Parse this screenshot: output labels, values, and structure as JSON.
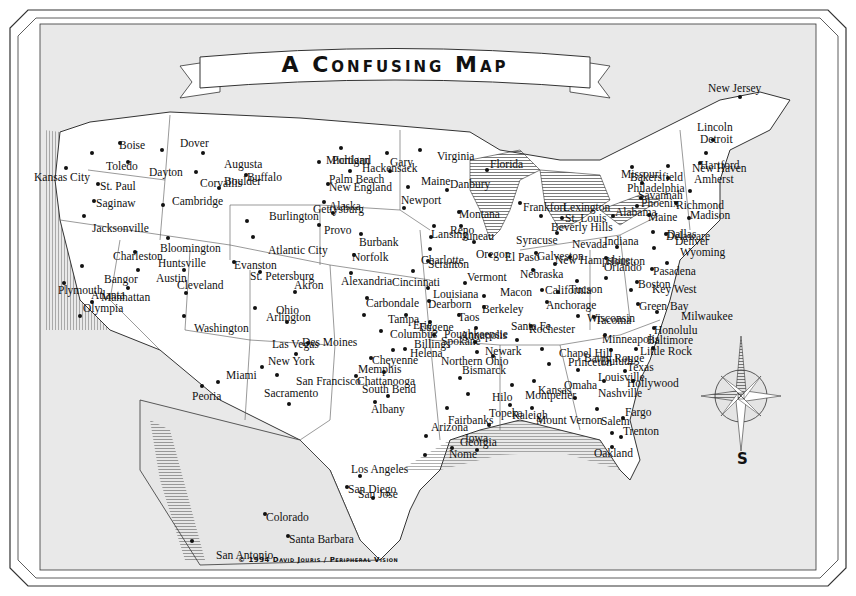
{
  "title": "A Confusing Map",
  "copyright": "© 1994 David Jouris / Peripheral Vision",
  "compass": {
    "label": "S"
  },
  "colors": {
    "land": "#ffffff",
    "water": "#e9e9e9",
    "ink": "#111111",
    "frame": "#333333"
  },
  "cities": [
    {
      "name": "Boise",
      "x": 120,
      "y": 143,
      "dx": -5,
      "dy": 3
    },
    {
      "name": "Toledo",
      "x": 92,
      "y": 153,
      "dx": 10,
      "dy": 14
    },
    {
      "name": "Dayton",
      "x": 128,
      "y": 162,
      "dx": 17,
      "dy": 11
    },
    {
      "name": "Dover",
      "x": 162,
      "y": 150,
      "dx": 14,
      "dy": -6
    },
    {
      "name": "Augusta",
      "x": 203,
      "y": 153,
      "dx": 17,
      "dy": 12
    },
    {
      "name": "Corvallis",
      "x": 196,
      "y": 172,
      "dx": 0,
      "dy": 12
    },
    {
      "name": "Buffalo",
      "x": 246,
      "y": 175,
      "dx": -3,
      "dy": 3
    },
    {
      "name": "Boulder",
      "x": 219,
      "y": 188,
      "dx": 1,
      "dy": -6
    },
    {
      "name": "Kansas City",
      "x": 66,
      "y": 168,
      "dx": 30,
      "dy": 10
    },
    {
      "name": "St. Paul",
      "x": 98,
      "y": 184,
      "dx": -2,
      "dy": 3
    },
    {
      "name": "Saginaw",
      "x": 94,
      "y": 201,
      "dx": -2,
      "dy": 3
    },
    {
      "name": "Jacksonville",
      "x": 84,
      "y": 216,
      "dx": 4,
      "dy": 13
    },
    {
      "name": "Cambridge",
      "x": 163,
      "y": 205,
      "dx": 5,
      "dy": -3
    },
    {
      "name": "Burlington",
      "x": 247,
      "y": 221,
      "dx": 18,
      "dy": -4
    },
    {
      "name": "Atlantic City",
      "x": 253,
      "y": 237,
      "dx": 11,
      "dy": 14
    },
    {
      "name": "Bloomington",
      "x": 168,
      "y": 238,
      "dx": 54,
      "dy": 11
    },
    {
      "name": "Evanston",
      "x": 234,
      "y": 262,
      "dx": -4,
      "dy": 4
    },
    {
      "name": "Charleston",
      "x": 135,
      "y": 252,
      "dx": 34,
      "dy": 5
    },
    {
      "name": "Huntsville",
      "x": 184,
      "y": 270,
      "dx": 30,
      "dy": -6
    },
    {
      "name": "Austin",
      "x": 138,
      "y": 270,
      "dx": 14,
      "dy": 9
    },
    {
      "name": "Bangor",
      "x": 82,
      "y": 266,
      "dx": 18,
      "dy": 14
    },
    {
      "name": "Manhattan",
      "x": 128,
      "y": 288,
      "dx": 23,
      "dy": 10
    },
    {
      "name": "Plymouth",
      "x": 64,
      "y": 283,
      "dx": 38,
      "dy": 8
    },
    {
      "name": "Atlanta",
      "x": 92,
      "y": 302,
      "dx": -5,
      "dy": -6
    },
    {
      "name": "Olympia",
      "x": 80,
      "y": 316,
      "dx": -1,
      "dy": -7
    },
    {
      "name": "Cleveland",
      "x": 186,
      "y": 293,
      "dx": 41,
      "dy": -7
    },
    {
      "name": "Washington",
      "x": 184,
      "y": 316,
      "dx": 6,
      "dy": 13
    },
    {
      "name": "Michigan",
      "x": 341,
      "y": 148,
      "dx": 29,
      "dy": 13
    },
    {
      "name": "Palm Beach",
      "x": 319,
      "y": 162,
      "dx": 6,
      "dy": 18
    },
    {
      "name": "Gary",
      "x": 387,
      "y": 153,
      "dx": 23,
      "dy": 10
    },
    {
      "name": "Portland",
      "x": 350,
      "y": 171,
      "dx": 26,
      "dy": -10
    },
    {
      "name": "Hackensack",
      "x": 390,
      "y": 171,
      "dx": 28,
      "dy": -2
    },
    {
      "name": "New England",
      "x": 328,
      "y": 184,
      "dx": -3,
      "dy": 4
    },
    {
      "name": "Maine",
      "x": 408,
      "y": 187,
      "dx": 9,
      "dy": -5
    },
    {
      "name": "Virginia",
      "x": 420,
      "y": 150,
      "dx": 13,
      "dy": 7
    },
    {
      "name": "Alaska",
      "x": 324,
      "y": 202,
      "dx": 37,
      "dy": 5
    },
    {
      "name": "Gettysburg",
      "x": 333,
      "y": 213,
      "dx": 36,
      "dy": -3
    },
    {
      "name": "Provo",
      "x": 319,
      "y": 225,
      "dx": 1,
      "dy": 6
    },
    {
      "name": "Burbank",
      "x": 361,
      "y": 234,
      "dx": 36,
      "dy": 9
    },
    {
      "name": "Newport",
      "x": 404,
      "y": 208,
      "dx": 35,
      "dy": -7
    },
    {
      "name": "Norfolk",
      "x": 354,
      "y": 255,
      "dx": 36,
      "dy": 3
    },
    {
      "name": "Alexandria",
      "x": 351,
      "y": 273,
      "dx": 46,
      "dy": 9
    },
    {
      "name": "St. Petersburg",
      "x": 260,
      "y": 272,
      "dx": 70,
      "dy": 5
    },
    {
      "name": "Akron",
      "x": 295,
      "y": 292,
      "dx": 25,
      "dy": -6
    },
    {
      "name": "Ohio",
      "x": 255,
      "y": 308,
      "dx": 17,
      "dy": 3
    },
    {
      "name": "Arlington",
      "x": 287,
      "y": 322,
      "dx": 29,
      "dy": -4
    },
    {
      "name": "Carbondale",
      "x": 367,
      "y": 298,
      "dx": 55,
      "dy": 6
    },
    {
      "name": "Tampa",
      "x": 364,
      "y": 315,
      "dx": 20,
      "dy": 5
    },
    {
      "name": "Erie",
      "x": 406,
      "y": 315,
      "dx": 3,
      "dy": 11
    },
    {
      "name": "Columbus",
      "x": 381,
      "y": 331,
      "dx": 53,
      "dy": 4
    },
    {
      "name": "Danbury",
      "x": 447,
      "y": 190,
      "dx": -1,
      "dy": -5
    },
    {
      "name": "Florida",
      "x": 487,
      "y": 170,
      "dx": -1,
      "dy": -5
    },
    {
      "name": "Montana",
      "x": 459,
      "y": 212,
      "dx": -4,
      "dy": 3
    },
    {
      "name": "Reno",
      "x": 434,
      "y": 226,
      "dx": 36,
      "dy": 5
    },
    {
      "name": "Juneau",
      "x": 461,
      "y": 226,
      "dx": 33,
      "dy": 11
    },
    {
      "name": "Lansing",
      "x": 431,
      "y": 237,
      "dx": 38,
      "dy": -2
    },
    {
      "name": "Charlotte",
      "x": 430,
      "y": 249,
      "dx": 41,
      "dy": 12
    },
    {
      "name": "Oregon",
      "x": 474,
      "y": 242,
      "dx": 34,
      "dy": 13
    },
    {
      "name": "Scranton",
      "x": 428,
      "y": 261,
      "dx": -4,
      "dy": 4
    },
    {
      "name": "Cincinnati",
      "x": 413,
      "y": 271,
      "dx": 35,
      "dy": 12
    },
    {
      "name": "El Paso",
      "x": 490,
      "y": 255,
      "dx": 11,
      "dy": 3
    },
    {
      "name": "Vermont",
      "x": 465,
      "y": 283,
      "dx": -2,
      "dy": -5
    },
    {
      "name": "Louisiana",
      "x": 428,
      "y": 288,
      "dx": 55,
      "dy": 7
    },
    {
      "name": "Dearborn",
      "x": 429,
      "y": 301,
      "dx": -5,
      "dy": 4
    },
    {
      "name": "Macon",
      "x": 484,
      "y": 296,
      "dx": 12,
      "dy": -3
    },
    {
      "name": "Taos",
      "x": 459,
      "y": 315,
      "dx": -5,
      "dy": 3
    },
    {
      "name": "Berkeley",
      "x": 484,
      "y": 307,
      "dx": -6,
      "dy": 3
    },
    {
      "name": "Eugene",
      "x": 430,
      "y": 322,
      "dx": 21,
      "dy": 6
    },
    {
      "name": "Annapolis",
      "x": 476,
      "y": 328,
      "dx": 34,
      "dy": 8
    },
    {
      "name": "Spokane",
      "x": 434,
      "y": 335,
      "dx": 3,
      "dy": 7
    },
    {
      "name": "Frankfort",
      "x": 520,
      "y": 203,
      "dx": -1,
      "dy": 5
    },
    {
      "name": "St. Louis",
      "x": 541,
      "y": 216,
      "dx": 20,
      "dy": 3
    },
    {
      "name": "Lexington",
      "x": 562,
      "y": 218,
      "dx": -3,
      "dy": -10
    },
    {
      "name": "Beverly Hills",
      "x": 557,
      "y": 233,
      "dx": -10,
      "dy": -5
    },
    {
      "name": "Syracuse",
      "x": 536,
      "y": 253,
      "dx": 24,
      "dy": -12
    },
    {
      "name": "Nevada",
      "x": 570,
      "y": 257,
      "dx": -2,
      "dy": -12
    },
    {
      "name": "New Hampshire",
      "x": 555,
      "y": 264,
      "dx": -4,
      "dy": -3
    },
    {
      "name": "Galveston",
      "x": 533,
      "y": 270,
      "dx": 54,
      "dy": -13
    },
    {
      "name": "Nebraska",
      "x": 542,
      "y": 290,
      "dx": -26,
      "dy": -15
    },
    {
      "name": "Tucson",
      "x": 577,
      "y": 281,
      "dx": -12,
      "dy": 9
    },
    {
      "name": "California",
      "x": 558,
      "y": 292,
      "dx": -17,
      "dy": -1
    },
    {
      "name": "Anchorage",
      "x": 547,
      "y": 302,
      "dx": -5,
      "dy": 4
    },
    {
      "name": "Wisconsin",
      "x": 578,
      "y": 316,
      "dx": 59,
      "dy": 3
    },
    {
      "name": "Tacoma",
      "x": 594,
      "y": 317,
      "dx": -3,
      "dy": 4
    },
    {
      "name": "Rochester",
      "x": 531,
      "y": 326,
      "dx": -6,
      "dy": 4
    },
    {
      "name": "Santa Fe",
      "x": 517,
      "y": 340,
      "dx": -10,
      "dy": -13
    },
    {
      "name": "Minneapolis",
      "x": 605,
      "y": 335,
      "dx": -7,
      "dy": 5
    },
    {
      "name": "Missouri",
      "x": 632,
      "y": 167,
      "dx": 33,
      "dy": 8
    },
    {
      "name": "Philadelphia",
      "x": 642,
      "y": 183,
      "dx": 53,
      "dy": 6
    },
    {
      "name": "Bakersfield",
      "x": 668,
      "y": 166,
      "dx": 24,
      "dy": 12
    },
    {
      "name": "Phoenix",
      "x": 641,
      "y": 198,
      "dx": -4,
      "dy": 6
    },
    {
      "name": "Savannah",
      "x": 637,
      "y": 206,
      "dx": -3,
      "dy": -10
    },
    {
      "name": "Alabama",
      "x": 613,
      "y": 216,
      "dx": 40,
      "dy": -3
    },
    {
      "name": "Maine",
      "x": 649,
      "y": 215,
      "dx": -5,
      "dy": 3
    },
    {
      "name": "Dallas",
      "x": 653,
      "y": 232,
      "dx": 46,
      "dy": 3
    },
    {
      "name": "Delaware",
      "x": 666,
      "y": 234,
      "dx": -4,
      "dy": 3
    },
    {
      "name": "Indiana",
      "x": 617,
      "y": 247,
      "dx": 25,
      "dy": -5
    },
    {
      "name": "Denver",
      "x": 654,
      "y": 248,
      "dx": 17,
      "dy": -6
    },
    {
      "name": "Houston",
      "x": 606,
      "y": 258,
      "dx": -4,
      "dy": 4
    },
    {
      "name": "Wyoming",
      "x": 667,
      "y": 263,
      "dx": 9,
      "dy": -10
    },
    {
      "name": "Pasadena",
      "x": 652,
      "y": 269,
      "dx": -3,
      "dy": 3
    },
    {
      "name": "Orlando",
      "x": 606,
      "y": 278,
      "dx": -6,
      "dy": -10
    },
    {
      "name": "Boston",
      "x": 637,
      "y": 282,
      "dx": -3,
      "dy": 3
    },
    {
      "name": "Key West",
      "x": 631,
      "y": 290,
      "dx": 17,
      "dy": 0
    },
    {
      "name": "Green Bay",
      "x": 638,
      "y": 304,
      "dx": -3,
      "dy": 3
    },
    {
      "name": "Milwaukee",
      "x": 657,
      "y": 312,
      "dx": 20,
      "dy": 5
    },
    {
      "name": "Honolulu",
      "x": 654,
      "y": 328,
      "dx": -4,
      "dy": 3
    },
    {
      "name": "Baltimore",
      "x": 653,
      "y": 348,
      "dx": 44,
      "dy": -7
    },
    {
      "name": "Baton Rouge",
      "x": 611,
      "y": 350,
      "dx": 35,
      "dy": 9
    },
    {
      "name": "Little Rock",
      "x": 636,
      "y": 349,
      "dx": 0,
      "dy": 3
    },
    {
      "name": "Duluth",
      "x": 578,
      "y": 370,
      "dx": 19,
      "dy": -8
    },
    {
      "name": "Texas",
      "x": 625,
      "y": 371,
      "dx": 28,
      "dy": -3
    },
    {
      "name": "Louisville",
      "x": 604,
      "y": 381,
      "dx": 50,
      "dy": -3
    },
    {
      "name": "Hollywood",
      "x": 633,
      "y": 381,
      "dx": -10,
      "dy": 3
    },
    {
      "name": "Omaha",
      "x": 575,
      "y": 398,
      "dx": -15,
      "dy": -12
    },
    {
      "name": "Nashville",
      "x": 597,
      "y": 409,
      "dx": -3,
      "dy": -15
    },
    {
      "name": "Fargo",
      "x": 623,
      "y": 418,
      "dx": -2,
      "dy": -5
    },
    {
      "name": "Salem",
      "x": 612,
      "y": 433,
      "dx": -15,
      "dy": -11
    },
    {
      "name": "Trenton",
      "x": 621,
      "y": 437,
      "dx": -2,
      "dy": -5
    },
    {
      "name": "Oakland",
      "x": 612,
      "y": 447,
      "dx": -22,
      "dy": 7
    },
    {
      "name": "New Jersey",
      "x": 740,
      "y": 97,
      "dx": -36,
      "dy": -8
    },
    {
      "name": "Lincoln",
      "x": 713,
      "y": 140,
      "dx": -20,
      "dy": -12
    },
    {
      "name": "Detroit",
      "x": 706,
      "y": 153,
      "dx": -10,
      "dy": -13
    },
    {
      "name": "Hartford",
      "x": 700,
      "y": 163,
      "dx": -4,
      "dy": 3
    },
    {
      "name": "New Haven",
      "x": 668,
      "y": 178,
      "dx": 20,
      "dy": -9
    },
    {
      "name": "Amherst",
      "x": 690,
      "y": 191,
      "dx": 0,
      "dy": -11
    },
    {
      "name": "Richmond",
      "x": 676,
      "y": 203,
      "dx": -4,
      "dy": 3
    },
    {
      "name": "Madison",
      "x": 689,
      "y": 218,
      "dx": -3,
      "dy": -2
    },
    {
      "name": "Des Moines",
      "x": 308,
      "y": 343,
      "dx": 50,
      "dy": 0
    },
    {
      "name": "Las Vegas",
      "x": 296,
      "y": 354,
      "dx": 26,
      "dy": -9
    },
    {
      "name": "New York",
      "x": 262,
      "y": 367,
      "dx": 50,
      "dy": -5
    },
    {
      "name": "San Francisco",
      "x": 277,
      "y": 375,
      "dx": 15,
      "dy": 7
    },
    {
      "name": "Miami",
      "x": 218,
      "y": 382,
      "dx": 4,
      "dy": -6
    },
    {
      "name": "Peoria",
      "x": 202,
      "y": 386,
      "dx": 22,
      "dy": 11
    },
    {
      "name": "Sacramento",
      "x": 289,
      "y": 404,
      "dx": 31,
      "dy": -10
    },
    {
      "name": "Helena",
      "x": 393,
      "y": 350,
      "dx": 49,
      "dy": 4
    },
    {
      "name": "Billings",
      "x": 405,
      "y": 349,
      "dx": 5,
      "dy": -4
    },
    {
      "name": "Cheyenne",
      "x": 371,
      "y": 358,
      "dx": -3,
      "dy": 3
    },
    {
      "name": "Memphis",
      "x": 356,
      "y": 376,
      "dx": 40,
      "dy": -6
    },
    {
      "name": "Chattanooga",
      "x": 384,
      "y": 372,
      "dx": 35,
      "dy": 10
    },
    {
      "name": "South Bend",
      "x": 388,
      "y": 396,
      "dx": 30,
      "dy": -6
    },
    {
      "name": "Albany",
      "x": 375,
      "y": 402,
      "dx": 28,
      "dy": 8
    },
    {
      "name": "Poughkeepsie",
      "x": 475,
      "y": 342,
      "dx": 37,
      "dy": -7
    },
    {
      "name": "Newark",
      "x": 477,
      "y": 352,
      "dx": 40,
      "dy": 0
    },
    {
      "name": "Chapel Hill",
      "x": 542,
      "y": 349,
      "dx": 13,
      "dy": 5
    },
    {
      "name": "Northern Ohio",
      "x": 493,
      "y": 356,
      "dx": 22,
      "dy": 6
    },
    {
      "name": "Princeton",
      "x": 549,
      "y": 364,
      "dx": 15,
      "dy": -1
    },
    {
      "name": "Bismarck",
      "x": 460,
      "y": 378,
      "dx": -2,
      "dy": -7
    },
    {
      "name": "Montpelier",
      "x": 512,
      "y": 385,
      "dx": 9,
      "dy": 11
    },
    {
      "name": "Kansas",
      "x": 534,
      "y": 381,
      "dx": 0,
      "dy": 10
    },
    {
      "name": "Hilo",
      "x": 468,
      "y": 394,
      "dx": 20,
      "dy": 4
    },
    {
      "name": "Raleigh",
      "x": 510,
      "y": 405,
      "dx": -2,
      "dy": 11
    },
    {
      "name": "Fairbanks",
      "x": 447,
      "y": 408,
      "dx": -3,
      "dy": 13
    },
    {
      "name": "Mount Vernon",
      "x": 532,
      "y": 408,
      "dx": 0,
      "dy": 13
    },
    {
      "name": "Topeka",
      "x": 489,
      "y": 425,
      "dx": -4,
      "dy": -11
    },
    {
      "name": "Arizona",
      "x": 426,
      "y": 436,
      "dx": 1,
      "dy": -8
    },
    {
      "name": "Georgia",
      "x": 477,
      "y": 450,
      "dx": 21,
      "dy": -7
    },
    {
      "name": "Iowa",
      "x": 452,
      "y": 448,
      "dx": 9,
      "dy": -9
    },
    {
      "name": "Nome",
      "x": 425,
      "y": 455,
      "dx": 20,
      "dy": 0
    },
    {
      "name": "Los Angeles",
      "x": 360,
      "y": 476,
      "dx": 53,
      "dy": -6
    },
    {
      "name": "San Diego",
      "x": 347,
      "y": 487,
      "dx": 51,
      "dy": 3
    },
    {
      "name": "San Jose",
      "x": 373,
      "y": 498,
      "dx": 29,
      "dy": -3
    },
    {
      "name": "Colorado",
      "x": 265,
      "y": 514,
      "dx": -3,
      "dy": 4
    },
    {
      "name": "Santa Barbara",
      "x": 288,
      "y": 536,
      "dx": -3,
      "dy": 4
    },
    {
      "name": "San Antonio",
      "x": 192,
      "y": 541,
      "dx": 20,
      "dy": 15
    }
  ]
}
